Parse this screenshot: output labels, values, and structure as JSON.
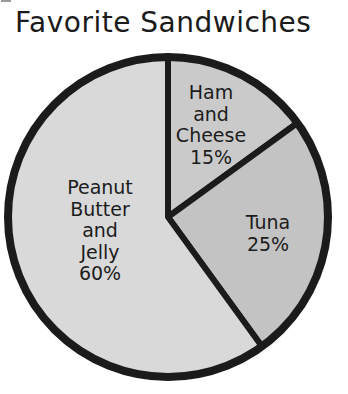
{
  "chart_data": {
    "type": "pie",
    "title": "Favorite Sandwiches",
    "legend": "none",
    "direction": "clockwise",
    "start_angle_deg": 0,
    "outline_color": "#1b1b1b",
    "background": "#ffffff",
    "slices": [
      {
        "label": "Ham and Cheese",
        "value": 15,
        "color": "#cacaca",
        "label_lines": [
          "Ham",
          "and",
          "Cheese",
          "15%"
        ]
      },
      {
        "label": "Tuna",
        "value": 25,
        "color": "#c3c3c3",
        "label_lines": [
          "Tuna",
          "25%"
        ]
      },
      {
        "label": "Peanut Butter and Jelly",
        "value": 60,
        "color": "#d9d9d9",
        "label_lines": [
          "Peanut",
          "Butter",
          "and",
          "Jelly",
          "60%"
        ]
      }
    ]
  }
}
